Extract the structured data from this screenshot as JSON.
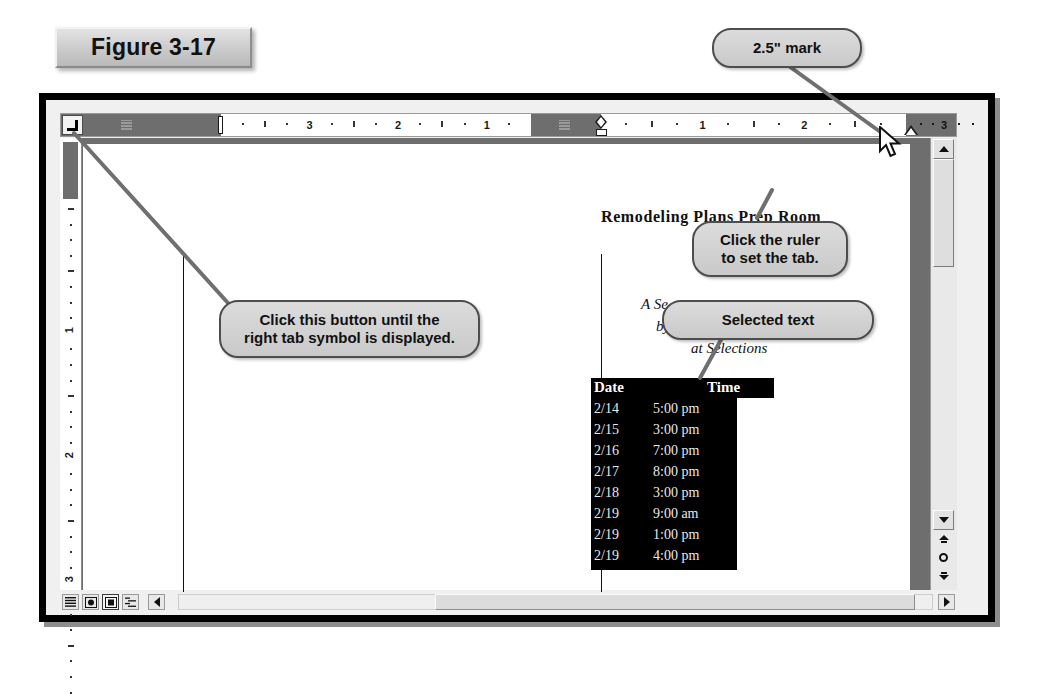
{
  "figure": {
    "label": "Figure 3-17"
  },
  "ruler": {
    "tab_button_icon": "right-tab-stop-icon",
    "left_numbers": [
      "3",
      "2",
      "1"
    ],
    "right_numbers": [
      "1",
      "2",
      "3"
    ],
    "unit": "inches",
    "table_icon": "table-grid-icon",
    "markers": {
      "first_line_indent": "first-line-indent-marker",
      "left_indent": "left-indent-marker",
      "right_indent": "right-indent-marker"
    }
  },
  "vertical_ruler": {
    "numbers": [
      "1",
      "2",
      "3"
    ]
  },
  "document": {
    "heading": "Remodeling Plans Prep Room",
    "sub_line_1": "A Se",
    "sub_line_2": "by",
    "sub_line_3": "at Selections",
    "table": {
      "headers": [
        "Date",
        "Time"
      ],
      "rows": [
        [
          "2/14",
          "5:00 pm"
        ],
        [
          "2/15",
          "3:00 pm"
        ],
        [
          "2/16",
          "7:00 pm"
        ],
        [
          "2/17",
          "8:00 pm"
        ],
        [
          "2/18",
          "3:00 pm"
        ],
        [
          "2/19",
          "9:00 am"
        ],
        [
          "2/19",
          "1:00 pm"
        ],
        [
          "2/19",
          "4:00 pm"
        ]
      ]
    }
  },
  "callouts": {
    "two_point_five_mark": "2.5\" mark",
    "click_ruler_line1": "Click the ruler",
    "click_ruler_line2": "to set the tab.",
    "selected_text": "Selected text",
    "click_button_line1": "Click this button until the",
    "click_button_line2": "right tab symbol is displayed."
  },
  "scrollbars": {
    "v_up": "scroll-up-arrow",
    "v_down": "scroll-down-arrow",
    "prev_page": "previous-page-button",
    "browse_object": "select-browse-object-button",
    "next_page": "next-page-button",
    "h_right": "scroll-right-arrow",
    "h_left": "scroll-left-arrow"
  },
  "view_buttons": [
    {
      "name": "normal-view-button",
      "icon": "lines-icon",
      "selected": false
    },
    {
      "name": "web-layout-view-button",
      "icon": "globe-icon",
      "selected": false
    },
    {
      "name": "print-layout-view-button",
      "icon": "page-icon",
      "selected": true
    },
    {
      "name": "outline-view-button",
      "icon": "outline-icon",
      "selected": false
    }
  ],
  "cursor": {
    "icon": "mouse-pointer-icon",
    "x": 888,
    "y": 134
  },
  "colors": {
    "callout_fill": "#d4d4d4",
    "callout_border": "#4d4d4d",
    "leader_line": "#6f6f6f",
    "margin_gray": "#6e6e6e",
    "selection_black": "#000000",
    "frame_black": "#000000"
  }
}
